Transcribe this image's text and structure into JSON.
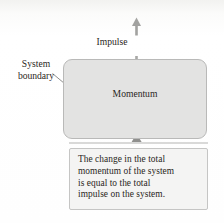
{
  "figure": {
    "background_color": "#fdfdfc",
    "system_box_fill": "#e3e3e2",
    "system_box_stroke": "#b9b9b8",
    "caption_box_fill": "#f4f4f3",
    "caption_box_stroke": "#c5c5c4",
    "text_color": "#2a2622",
    "arrow_color": "#9b9b99"
  },
  "labels": {
    "impulse": "Impulse",
    "momentum": "Momentum",
    "system_boundary": "System\nboundary"
  },
  "caption": {
    "text": "The change in the total\nmomentum of the system\nis equal to the total\nimpulse on the system."
  },
  "icons": {
    "impulse_arrow_top": "arrow-up-icon",
    "impulse_arrow_into_box": "arrow-down-icon",
    "caption_pointer": "arrow-up-icon",
    "boundary_leader": "leader-line-icon"
  }
}
